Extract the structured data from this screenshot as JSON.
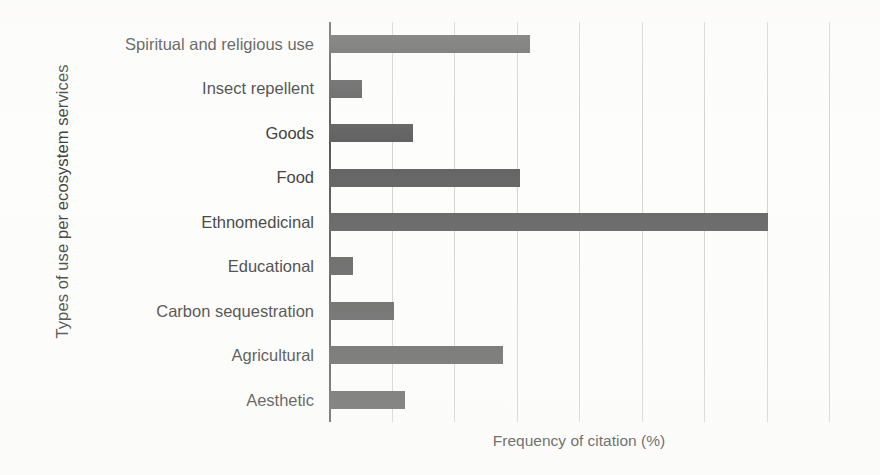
{
  "chart_data": {
    "type": "bar",
    "orientation": "horizontal",
    "title": "",
    "xlabel": "Frequency of citation (%)",
    "ylabel": "Types of use per ecosystem services",
    "categories": [
      "Spiritual and religious use",
      "Insect repellent",
      "Goods",
      "Food",
      "Ethnomedicinal",
      "Educational",
      "Carbon sequestration",
      "Agricultural",
      "Aesthetic"
    ],
    "values": [
      16.1,
      2.6,
      6.7,
      15.3,
      35.1,
      1.9,
      5.2,
      13.9,
      6.1
    ],
    "xlim": [
      0,
      40
    ],
    "xticks": [
      0,
      5,
      10,
      15,
      20,
      25,
      30,
      35,
      40
    ],
    "grid": "vertical",
    "legend": "none",
    "bar_color": "#626262",
    "gridline_color": "#d2d2d2",
    "axis_color": "#5a5a5a",
    "tick_labels_visible": false
  }
}
